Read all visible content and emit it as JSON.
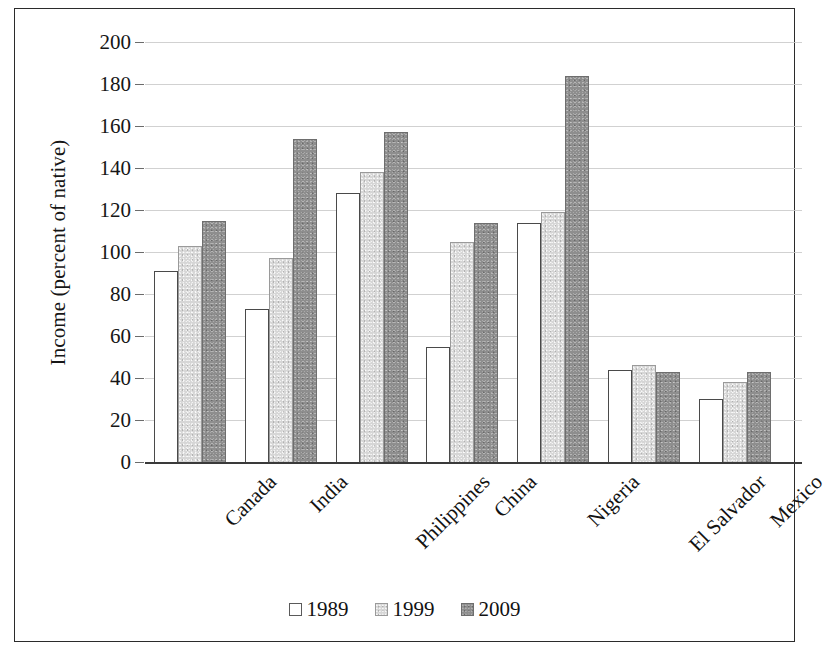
{
  "chart_data": {
    "type": "bar",
    "title": "",
    "xlabel": "",
    "ylabel": "Income (percent of native)",
    "ylim": [
      0,
      200
    ],
    "ytick_step": 20,
    "yticks": [
      "200",
      "180",
      "160",
      "140",
      "120",
      "100",
      "80",
      "60",
      "40",
      "20",
      "0"
    ],
    "grid": true,
    "legend_position": "bottom",
    "categories": [
      "Canada",
      "India",
      "Philippines",
      "China",
      "Nigeria",
      "El Salvador",
      "Mexico"
    ],
    "series": [
      {
        "name": "1989",
        "color": "#ffffff",
        "values": [
          91,
          73,
          128,
          55,
          114,
          44,
          30
        ]
      },
      {
        "name": "1999",
        "color": "#d6d6d6",
        "values": [
          103,
          97,
          138,
          105,
          119,
          46,
          38
        ]
      },
      {
        "name": "2009",
        "color": "#8e8e8e",
        "values": [
          115,
          154,
          157,
          114,
          184,
          43,
          43
        ]
      }
    ]
  },
  "legend": {
    "items": [
      {
        "label": "1989",
        "swatch": "white-square-swatch"
      },
      {
        "label": "1999",
        "swatch": "light-gray-square-swatch"
      },
      {
        "label": "2009",
        "swatch": "dark-gray-square-swatch"
      }
    ]
  },
  "colors": {
    "series_1989": "#ffffff",
    "series_1999": "#d6d6d6",
    "series_2009": "#8e8e8e",
    "gridline": "#c9c9c9",
    "axis": "#3a3a3a",
    "frame": "#2b2b2b",
    "text": "#121212"
  }
}
